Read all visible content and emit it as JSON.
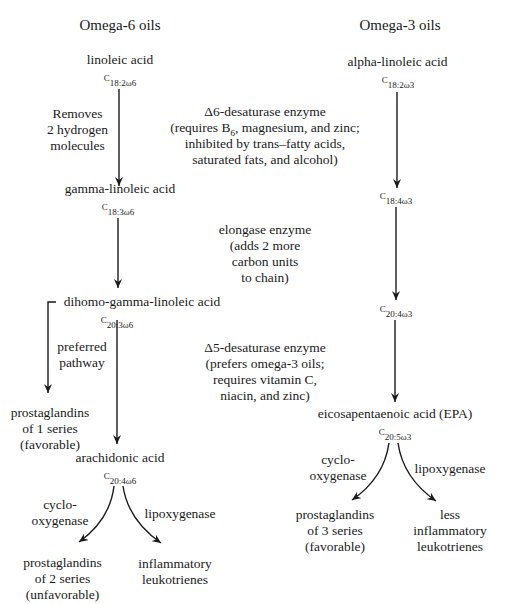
{
  "columns": {
    "omega6": {
      "title": "Omega-6 oils",
      "nodes": [
        {
          "name": "linoleic acid",
          "formula_c": "C",
          "formula_sub": "18:2ω6"
        },
        {
          "name": "gamma-linoleic acid",
          "formula_c": "C",
          "formula_sub": "18:3ω6"
        },
        {
          "name": "dihomo-gamma-linoleic acid",
          "formula_c": "C",
          "formula_sub": "20:3ω6"
        },
        {
          "name": "arachidonic acid",
          "formula_c": "C",
          "formula_sub": "20:4ω6"
        }
      ],
      "side_note": "Removes\n2 hydrogen\nmolecules",
      "branch_label": "preferred\npathway",
      "branch_product": "prostaglandins\nof 1 series\n(favorable)",
      "cox_label": "cyclo-\noxygenase",
      "lox_label": "lipoxygenase",
      "cox_product": "prostaglandins\nof 2 series\n(unfavorable)",
      "lox_product": "inflammatory\nleukotrienes"
    },
    "omega3": {
      "title": "Omega-3 oils",
      "nodes": [
        {
          "name": "alpha-linoleic acid",
          "formula_c": "C",
          "formula_sub": "18:2ω3"
        },
        {
          "name": "",
          "formula_c": "C",
          "formula_sub": "18:4ω3"
        },
        {
          "name": "",
          "formula_c": "C",
          "formula_sub": "20:4ω3"
        },
        {
          "name": "eicosapentaenoic acid (EPA)",
          "formula_c": "C",
          "formula_sub": "20:5ω3"
        }
      ],
      "cox_label": "cyclo-\noxygenase",
      "lox_label": "lipoxygenase",
      "cox_product": "prostaglandins\nof 3 series\n(favorable)",
      "lox_product": "less\ninflammatory\nleukotrienes"
    }
  },
  "enzymes": {
    "delta6": {
      "title": "Δ6-desaturase enzyme",
      "line1_pre": "(requires B",
      "line1_sub": "6",
      "line1_post": ", magnesium, and zinc;",
      "rest": "inhibited by trans–fatty acids,\nsaturated fats, and alcohol)"
    },
    "elongase": {
      "text": "elongase enzyme\n(adds 2 more\ncarbon units\nto chain)"
    },
    "delta5": {
      "text": "Δ5-desaturase enzyme\n(prefers omega-3 oils;\nrequires vitamin C,\nniacin, and zinc)"
    }
  },
  "colors": {
    "ink": "#1a1a1a",
    "background": "#ffffff"
  }
}
